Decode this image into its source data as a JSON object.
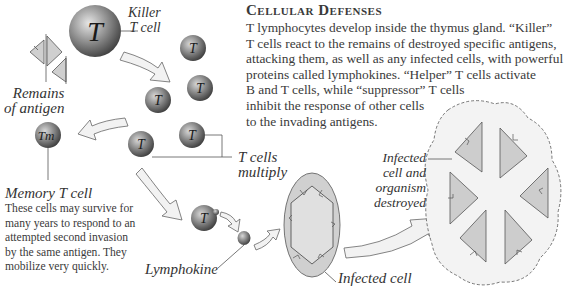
{
  "header": {
    "title": "Cellular Defenses",
    "body_lines": [
      "T lymphocytes develop inside the thymus gland. “Killer”",
      "T cells react to the remains of destroyed specific antigens,",
      "attacking them, as well as any infected cells, with powerful",
      "proteins called lymphokines. “Helper” T cells activate",
      "B and T cells, while “suppressor” T cells",
      "inhibit the response of other cells",
      "to the invading antigens."
    ]
  },
  "labels": {
    "killer": "Killer\nT cell",
    "remains": "Remains\nof antigen",
    "multiply": "T cells\nmultiply",
    "memory_title": "Memory T cell",
    "memory_text": "These cells may survive for\nmany years to respond to an\nattempted second invasion\nby the same antigen. They\nmobilize very quickly.",
    "lymphokine": "Lymphokine",
    "infected_cell": "Infected cell",
    "destroyed": "Infected\ncell and\norganism\ndestroyed"
  },
  "cells": {
    "killer_glyph": "T",
    "t_glyph": "T",
    "memory_glyph": "Tm"
  },
  "colors": {
    "cell_dark": "#4a4a4a",
    "cell_light": "#cfcfcf",
    "antigen_fill": "#c8c8c8",
    "infected_fill": "#d6d6d6",
    "arrow_fill": "#f0f0f0",
    "destroyed_bg": "#f2f2f2"
  }
}
